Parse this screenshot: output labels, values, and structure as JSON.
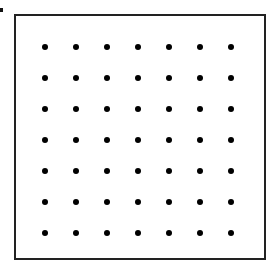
{
  "diagram": {
    "type": "dot-grid",
    "rows": 7,
    "columns": 7,
    "origin_x": 45,
    "origin_y": 47,
    "spacing_x": 31,
    "spacing_y": 31,
    "dot_color": "#000000",
    "border_color": "#222222"
  }
}
